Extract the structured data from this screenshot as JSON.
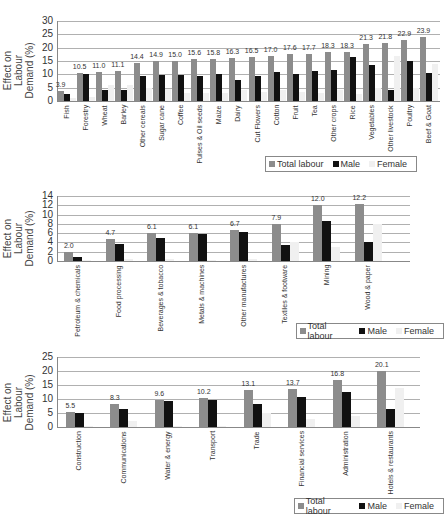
{
  "page_header_fragment": "",
  "legend": {
    "items": [
      {
        "label": "Total labour",
        "color": "#8c8c8c"
      },
      {
        "label": "Male",
        "color": "#111111"
      },
      {
        "label": "Female",
        "color": "#f0f0f0"
      }
    ]
  },
  "chart_data": [
    {
      "type": "bar",
      "title": "",
      "xlabel": "",
      "ylabel": "Effect on Labour Demand (%)",
      "ylim": [
        0,
        30
      ],
      "yticks": [
        0,
        5,
        10,
        15,
        20,
        25,
        30
      ],
      "grid": true,
      "legend_position": "bottom-right",
      "categories": [
        "Fish",
        "Forestry",
        "Wheat",
        "Barley",
        "Other cereals",
        "Sugar cane",
        "Coffee",
        "Pulses & Oil seeds",
        "Maize",
        "Dairy",
        "Cut Flowers",
        "Cotton",
        "Fruit",
        "Tea",
        "Other crops",
        "Rice",
        "Vegetables",
        "Other livestock",
        "Poultry",
        "Beef & Goat"
      ],
      "series": [
        {
          "name": "Total labour",
          "values": [
            3.9,
            10.5,
            11.0,
            11.1,
            14.4,
            14.9,
            15.0,
            15.6,
            15.8,
            16.3,
            16.5,
            17.0,
            17.6,
            17.7,
            18.3,
            18.3,
            21.3,
            21.8,
            22.9,
            23.9
          ]
        },
        {
          "name": "Male",
          "values": [
            2.5,
            10.3,
            4.2,
            4.2,
            9.3,
            9.6,
            9.6,
            9.2,
            10.2,
            8.0,
            9.5,
            11.0,
            10.2,
            11.3,
            11.5,
            16.5,
            13.5,
            4.3,
            14.9,
            10.4
          ]
        },
        {
          "name": "Female",
          "values": [
            1.0,
            1.5,
            6.0,
            6.0,
            5.0,
            4.5,
            3.0,
            3.0,
            3.0,
            4.0,
            3.5,
            4.0,
            3.5,
            3.0,
            4.0,
            2.5,
            5.0,
            17.0,
            5.0,
            14.0
          ]
        }
      ],
      "data_labels": [
        "3.9",
        "10.5",
        "11.0",
        "11.1",
        "14.4",
        "14.9",
        "15.0",
        "15.6",
        "15.8",
        "16.3",
        "16.5",
        "17.0",
        "17.6",
        "17.7",
        "18.3",
        "18.3",
        "21.3",
        "21.8",
        "22.9",
        "23.9"
      ]
    },
    {
      "type": "bar",
      "title": "",
      "xlabel": "",
      "ylabel": "Effect on Labour Demand (%)",
      "ylim": [
        0,
        14
      ],
      "yticks": [
        0,
        2,
        4,
        6,
        8,
        10,
        12,
        14
      ],
      "grid": true,
      "legend_position": "bottom-right",
      "categories": [
        "Petroleum & chemicals",
        "Food processing",
        "Beverages & tobacco",
        "Metals & machines",
        "Other manufactures",
        "Textiles & footware",
        "Mining",
        "Wood & paper"
      ],
      "series": [
        {
          "name": "Total labour",
          "values": [
            2.0,
            4.7,
            6.1,
            6.1,
            6.7,
            7.9,
            12.0,
            12.2
          ]
        },
        {
          "name": "Male",
          "values": [
            0.9,
            3.6,
            5.0,
            5.8,
            6.2,
            3.5,
            8.6,
            4.1
          ]
        },
        {
          "name": "Female",
          "values": [
            0.2,
            0.5,
            0.5,
            0.3,
            0.5,
            4.0,
            3.0,
            8.0
          ]
        }
      ],
      "data_labels": [
        "2.0",
        "4.7",
        "6.1",
        "6.1",
        "6.7",
        "7.9",
        "12.0",
        "12.2"
      ]
    },
    {
      "type": "bar",
      "title": "",
      "xlabel": "",
      "ylabel": "Effect on Labour Demand (%)",
      "ylim": [
        0,
        25
      ],
      "yticks": [
        0,
        5,
        10,
        15,
        20,
        25
      ],
      "grid": true,
      "legend_position": "bottom-right",
      "categories": [
        "Construction",
        "Communications",
        "Water & energy",
        "Transport",
        "Trade",
        "Financial services",
        "Administration",
        "Hotels & restaurants"
      ],
      "series": [
        {
          "name": "Total labour",
          "values": [
            5.5,
            8.3,
            9.6,
            10.2,
            13.1,
            13.7,
            16.8,
            20.1
          ]
        },
        {
          "name": "Male",
          "values": [
            5.0,
            6.3,
            9.4,
            9.6,
            8.1,
            10.8,
            12.6,
            6.3
          ]
        },
        {
          "name": "Female",
          "values": [
            0.3,
            2.0,
            0.5,
            0.5,
            5.0,
            3.0,
            4.0,
            14.0
          ]
        }
      ],
      "data_labels": [
        "5.5",
        "8.3",
        "9.6",
        "10.2",
        "13.1",
        "13.7",
        "16.8",
        "20.1"
      ]
    }
  ]
}
